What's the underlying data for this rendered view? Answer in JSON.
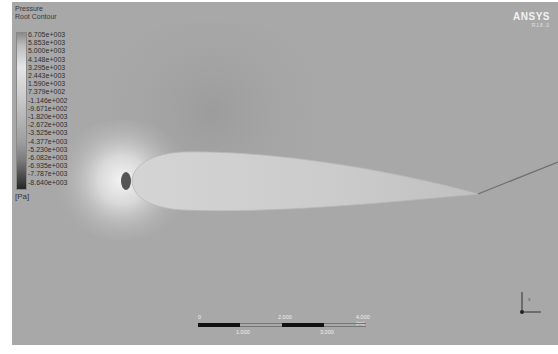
{
  "legend": {
    "title_line1": "Pressure",
    "title_line2": "Root Contour",
    "values": [
      "6.705e+003",
      "5.853e+003",
      "5.000e+003",
      "4.148e+003",
      "3.295e+003",
      "2.443e+003",
      "1.590e+003",
      "7.379e+002",
      "-1.146e+002",
      "-9.671e+002",
      "-1.820e+003",
      "-2.672e+003",
      "-3.525e+003",
      "-4.377e+003",
      "-5.230e+003",
      "-6.082e+003",
      "-6.935e+003",
      "-7.787e+003",
      "-8.640e+003"
    ],
    "unit": "[Pa]"
  },
  "brand": {
    "name": "ANSYS",
    "version": "R18.0"
  },
  "scale_bar": {
    "top_labels": [
      "0",
      "2.000",
      "4.000 (m)"
    ],
    "bottom_labels": [
      "1.000",
      "3.000"
    ]
  },
  "triad": {
    "axes": [
      "X",
      "Y"
    ]
  },
  "colors": {
    "background": "#a9a9a9",
    "airfoil": "#c9c9c9",
    "stagnation": "#3a3a3a"
  }
}
